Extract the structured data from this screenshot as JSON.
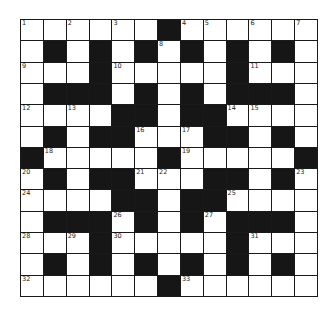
{
  "puzzle": {
    "rows": 13,
    "cols": 13,
    "grid": [
      "......#......",
      ".#.#.#.#.#.#.",
      "...#.....#...",
      ".###.#.#.###.",
      "....##.##....",
      ".#.##...##.#.",
      "#.....#.....#",
      ".#.##...##.#.",
      "....##.##....",
      ".###.#.#.###.",
      "...#.....#...",
      ".#.#.#.#.#.#.",
      "......#......"
    ],
    "numbers": [
      {
        "r": 0,
        "c": 0,
        "n": "1"
      },
      {
        "r": 0,
        "c": 2,
        "n": "2"
      },
      {
        "r": 0,
        "c": 4,
        "n": "3"
      },
      {
        "r": 0,
        "c": 7,
        "n": "4"
      },
      {
        "r": 0,
        "c": 8,
        "n": "5"
      },
      {
        "r": 0,
        "c": 10,
        "n": "6"
      },
      {
        "r": 0,
        "c": 12,
        "n": "7"
      },
      {
        "r": 1,
        "c": 6,
        "n": "8"
      },
      {
        "r": 2,
        "c": 0,
        "n": "9"
      },
      {
        "r": 2,
        "c": 4,
        "n": "10"
      },
      {
        "r": 2,
        "c": 10,
        "n": "11"
      },
      {
        "r": 4,
        "c": 0,
        "n": "12"
      },
      {
        "r": 4,
        "c": 2,
        "n": "13"
      },
      {
        "r": 4,
        "c": 9,
        "n": "14"
      },
      {
        "r": 4,
        "c": 10,
        "n": "15"
      },
      {
        "r": 5,
        "c": 5,
        "n": "16"
      },
      {
        "r": 5,
        "c": 7,
        "n": "17"
      },
      {
        "r": 6,
        "c": 1,
        "n": "18"
      },
      {
        "r": 6,
        "c": 7,
        "n": "19"
      },
      {
        "r": 7,
        "c": 0,
        "n": "20"
      },
      {
        "r": 7,
        "c": 5,
        "n": "21"
      },
      {
        "r": 7,
        "c": 6,
        "n": "22"
      },
      {
        "r": 7,
        "c": 12,
        "n": "23"
      },
      {
        "r": 8,
        "c": 0,
        "n": "24"
      },
      {
        "r": 8,
        "c": 9,
        "n": "25"
      },
      {
        "r": 9,
        "c": 4,
        "n": "26"
      },
      {
        "r": 9,
        "c": 8,
        "n": "27"
      },
      {
        "r": 10,
        "c": 0,
        "n": "28"
      },
      {
        "r": 10,
        "c": 2,
        "n": "29"
      },
      {
        "r": 10,
        "c": 4,
        "n": "30"
      },
      {
        "r": 10,
        "c": 10,
        "n": "31"
      },
      {
        "r": 12,
        "c": 0,
        "n": "32"
      },
      {
        "r": 12,
        "c": 7,
        "n": "33"
      }
    ],
    "colors": {
      "block": "#161616",
      "cell": "#ffffff",
      "line": "#1a1a1a"
    }
  }
}
